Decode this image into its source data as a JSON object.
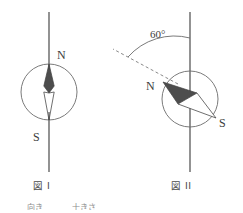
{
  "document": {
    "kind": "science-diagram",
    "subject": "magnetic compass needle orientation"
  },
  "figures": [
    {
      "id": "figure-1",
      "caption": "図 I",
      "description": "compass needle aligned with the vertical line",
      "pole_labels": {
        "north": "N",
        "south": "S"
      },
      "needle_tilt_degrees": 0,
      "geometry": {
        "circle_center_x": 49,
        "circle_center_y": 92,
        "circle_radius": 28,
        "line_x": 49,
        "line_top_y": 12,
        "line_bottom_y": 172
      }
    },
    {
      "id": "figure-2",
      "caption": "図 II",
      "description": "compass needle deflected from the vertical line",
      "pole_labels": {
        "north": "N",
        "south": "S"
      },
      "needle_tilt_degrees": 60,
      "angle_label": "60°",
      "geometry": {
        "circle_center_x": 190,
        "circle_center_y": 99,
        "circle_radius": 28,
        "line_x": 190,
        "line_top_y": 12,
        "line_bottom_y": 172
      }
    }
  ],
  "footer": {
    "fragment_left": "向き",
    "fragment_right": "十きさ"
  },
  "colors": {
    "stroke": "#4a4a4a",
    "needle_north_fill": "#4d4d4d",
    "needle_south_fill": "#ffffff",
    "circle_stroke": "#6b6b6b",
    "dashed_stroke": "#7a7a7a",
    "text": "#3d3d3d",
    "background": "#ffffff"
  }
}
